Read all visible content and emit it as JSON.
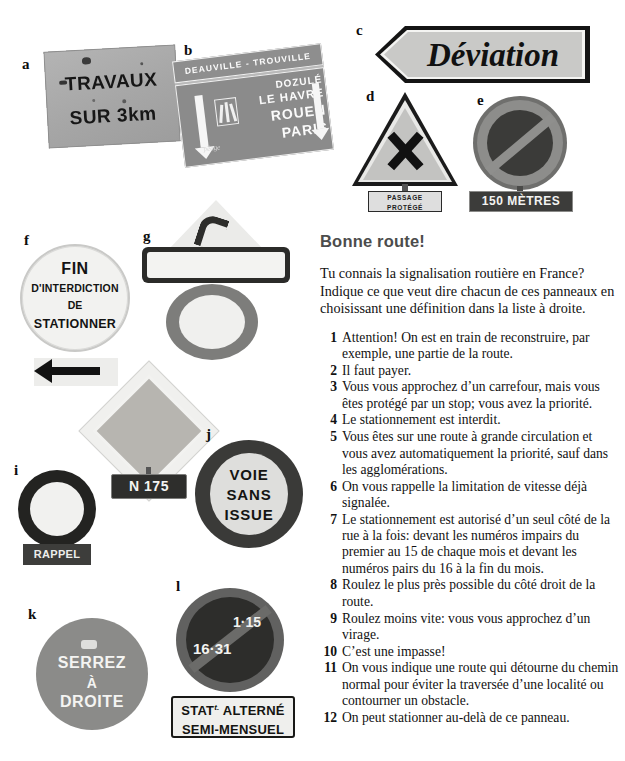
{
  "heading": "Bonne route!",
  "intro": "Tu connais la signalisation routière en France? Indique ce que veut dire chacun de ces panneaux en choisissant une définition dans la liste à droite.",
  "definitions": [
    {
      "num": "1",
      "text": "Attention! On est en train de reconstruire, par exemple, une partie de la route."
    },
    {
      "num": "2",
      "text": "Il faut payer."
    },
    {
      "num": "3",
      "text": "Vous vous approchez d’un carrefour, mais vous êtes protégé par un stop; vous avez la priorité."
    },
    {
      "num": "4",
      "text": "Le stationnement est interdit."
    },
    {
      "num": "5",
      "text": "Vous êtes sur une route à grande circulation et vous avez automatiquement la priorité, sauf dans les agglomérations."
    },
    {
      "num": "6",
      "text": "On vous rappelle la limitation de vitesse déjà signalée."
    },
    {
      "num": "7",
      "text": "Le stationnement est autorisé d’un seul côté de la rue à la fois: devant les numéros impairs du premier au 15 de chaque mois et devant les numéros pairs du 16 à la fin du mois."
    },
    {
      "num": "8",
      "text": "Roulez le plus près possible du côté droit de la route."
    },
    {
      "num": "9",
      "text": "Roulez moins vite: vous vous approchez d’un virage."
    },
    {
      "num": "10",
      "text": "C’est une impasse!"
    },
    {
      "num": "11",
      "text": "On vous indique une route qui détourne du chemin normal pour éviter la traversée d’une localité ou contourner un obstacle."
    },
    {
      "num": "12",
      "text": "On peut stationner au-delà de ce panneau."
    }
  ],
  "signs": {
    "a": {
      "tag": "a",
      "line1": "TRAVAUX",
      "line2": "SUR 3km"
    },
    "b": {
      "tag": "b",
      "band": "DEAUVILLE - TROUVILLE",
      "dest1": "DOZULÉ",
      "dest2": "LE HAVRE",
      "dest3": "ROUEN",
      "dest4": "PARIS",
      "toll": "péage"
    },
    "c": {
      "tag": "c",
      "text": "Déviation"
    },
    "d": {
      "tag": "d",
      "plate1": "PASSAGE",
      "plate2": "PROTÉGÉ"
    },
    "e": {
      "tag": "e",
      "plate": "150 MÈTRES"
    },
    "f": {
      "tag": "f",
      "line1": "FIN",
      "line2": "D'INTERDICTION",
      "line3": "DE",
      "line4": "STATIONNER"
    },
    "g": {
      "tag": "g",
      "plate": "RALENTISSEZ",
      "speed": "40"
    },
    "h": {
      "tag": "h",
      "plate": "N 175"
    },
    "i": {
      "tag": "i",
      "speed": "80",
      "plate": "RAPPEL"
    },
    "j": {
      "tag": "j",
      "line1": "VOIE",
      "line2": "SANS",
      "line3": "ISSUE"
    },
    "k": {
      "tag": "k",
      "line1": "SERREZ",
      "line2": "À",
      "line3": "DROITE"
    },
    "l": {
      "tag": "l",
      "num1": "1·15",
      "num2": "16·31",
      "plate1pre": "STAT",
      "plate1sup": "t.",
      "plate1post": " ALTERNÉ",
      "plate2": "SEMI-MENSUEL"
    }
  },
  "colors": {
    "page_background": "#ffffff",
    "heading_color": "#4c4c4c",
    "body_text": "#111111"
  }
}
